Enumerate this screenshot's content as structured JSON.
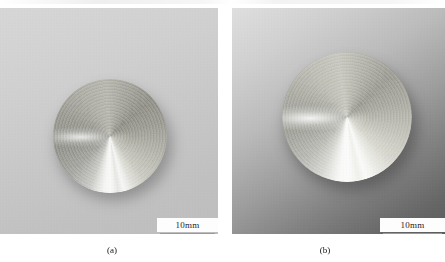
{
  "figure": {
    "panels": [
      {
        "id": "a",
        "caption": "(a)",
        "scalebar_label": "10mm",
        "specimen": "turned-metal-disc",
        "background_tone": "#c9c9c9"
      },
      {
        "id": "b",
        "caption": "(b)",
        "scalebar_label": "10mm",
        "specimen": "turned-metal-disc",
        "background_tone": "#9d9d9d"
      }
    ],
    "colors": {
      "page_background": "#ffffff",
      "scalebar_background": "#fdfdfd",
      "scalebar_rule": "#9a9a9a",
      "caption_text": "#141414",
      "panel_a_background": "#c9c9c9",
      "panel_b_background": "#9d9d9d",
      "disc_highlight": "#ffffff"
    }
  }
}
